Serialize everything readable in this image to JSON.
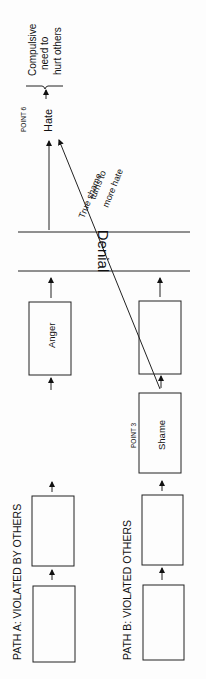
{
  "diagram": {
    "path_a": {
      "label": "PATH A:  VIOLATED BY OTHERS",
      "boxes": [
        "",
        "",
        "Anger"
      ]
    },
    "path_b": {
      "label": "PATH B:  VIOLATED OTHERS",
      "boxes": [
        "",
        "",
        "Shame",
        ""
      ],
      "point_label": "POINT 3"
    },
    "denial": "Denial",
    "hate": "Hate",
    "point6": "POINT 6",
    "outcome": [
      "Compulsive",
      "need to",
      "hurt others"
    ],
    "diagonal_label": [
      "True shame",
      "turns to",
      "more hate"
    ]
  }
}
